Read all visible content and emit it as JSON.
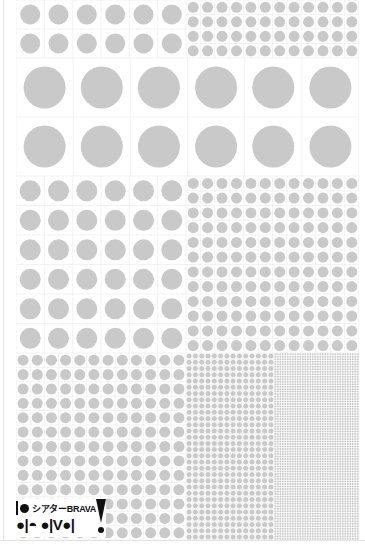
{
  "sheet": {
    "description": "Screen tone dot pattern sample sheet",
    "dot_color": "#c9c9c9",
    "grid_color": "#ececec",
    "background": "#ffffff"
  },
  "panels": [
    {
      "id": "p1",
      "x": 16,
      "y": 0,
      "w": 170,
      "h": 58,
      "cols": 6,
      "rows": 2,
      "dot": 20
    },
    {
      "id": "p2",
      "x": 186,
      "y": 0,
      "w": 173,
      "h": 58,
      "cols": 12,
      "rows": 4,
      "dot": 11
    },
    {
      "id": "p3",
      "x": 16,
      "y": 58,
      "w": 343,
      "h": 118,
      "cols": 6,
      "rows": 2,
      "dot": 42
    },
    {
      "id": "p4",
      "x": 16,
      "y": 176,
      "w": 170,
      "h": 177,
      "cols": 6,
      "rows": 6,
      "dot": 21
    },
    {
      "id": "p5",
      "x": 186,
      "y": 176,
      "w": 173,
      "h": 177,
      "cols": 12,
      "rows": 12,
      "dot": 11
    },
    {
      "id": "p6",
      "x": 16,
      "y": 353,
      "w": 170,
      "h": 187,
      "cols": 12,
      "rows": 13,
      "dot": 11
    },
    {
      "id": "p7",
      "x": 186,
      "y": 353,
      "w": 88,
      "h": 187,
      "cols": 14,
      "rows": 30,
      "dot": 5
    },
    {
      "id": "p8",
      "x": 274,
      "y": 353,
      "w": 85,
      "h": 187,
      "cols": 34,
      "rows": 75,
      "dot": 2
    }
  ],
  "logo": {
    "title": "シアターBRAVA",
    "subtitle": "●|◓ ●|V●|",
    "exclamation": "!"
  }
}
